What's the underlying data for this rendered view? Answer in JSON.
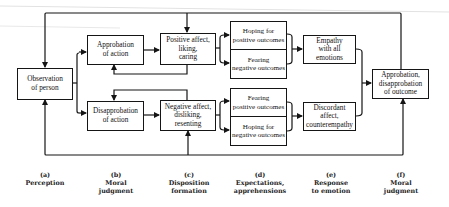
{
  "diagram": {
    "boxes": {
      "observation": {
        "line1": "Observation",
        "line2": "of person"
      },
      "approbation_action": {
        "line1": "Approbation",
        "line2": "of action"
      },
      "disapprobation_action": {
        "line1": "Disapprobation",
        "line2": "of action"
      },
      "positive_affect": {
        "line1": "Positive affect,",
        "line2": "liking,",
        "line3": "caring"
      },
      "negative_affect": {
        "line1": "Negative affect,",
        "line2": "disliking,",
        "line3": "resenting"
      },
      "top_expectations": {
        "upper": {
          "line1": "Hoping for",
          "line2": "positive outcomes"
        },
        "lower": {
          "line1": "Fearing",
          "line2": "negative outcomes"
        }
      },
      "bottom_expectations": {
        "upper": {
          "line1": "Fearing",
          "line2": "positive outcomes"
        },
        "lower": {
          "line1": "Hoping for",
          "line2": "negative outcomes"
        }
      },
      "empathy": {
        "line1": "Empathy",
        "line2": "with all",
        "line3": "emotions"
      },
      "discordant": {
        "line1": "Discordant affect,",
        "line2": "counterempathy"
      },
      "outcome": {
        "line1": "Approbation,",
        "line2": "disapprobation",
        "line3": "of outcome"
      }
    },
    "stages": [
      {
        "letter": "(a)",
        "line1": "Perception",
        "line2": ""
      },
      {
        "letter": "(b)",
        "line1": "Moral",
        "line2": "judgment"
      },
      {
        "letter": "(c)",
        "line1": "Disposition",
        "line2": "formation"
      },
      {
        "letter": "(d)",
        "line1": "Expectations,",
        "line2": "apprehensions"
      },
      {
        "letter": "(e)",
        "line1": "Response",
        "line2": "to  emotion"
      },
      {
        "letter": "(f)",
        "line1": "Moral",
        "line2": "judgment"
      }
    ],
    "colors": {
      "line": "#151515",
      "background": "#ffffff"
    }
  }
}
